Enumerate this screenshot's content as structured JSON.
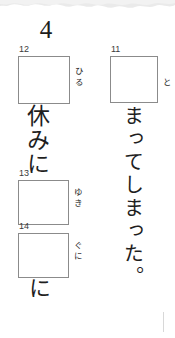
{
  "page": {
    "section_number": "4",
    "background_color": "#ffffff",
    "box_border_color": "#8b8b8b",
    "ink_color": "#1f1f1f"
  },
  "columns": {
    "left": {
      "blanks": [
        {
          "number": "12",
          "furigana": "ひる",
          "x": 18,
          "y": 56,
          "w": 52,
          "h": 48
        },
        {
          "number": "13",
          "furigana": "ゆき",
          "x": 18,
          "y": 180,
          "w": 51,
          "h": 45
        },
        {
          "number": "14",
          "furigana": "ぐに",
          "x": 18,
          "y": 233,
          "w": 51,
          "h": 45
        }
      ],
      "runs": [
        {
          "id": "text-left-1",
          "text": "休みに"
        },
        {
          "id": "text-left-2",
          "text": "に"
        }
      ]
    },
    "right": {
      "blanks": [
        {
          "number": "11",
          "furigana": "と",
          "x": 110,
          "y": 56,
          "w": 48,
          "h": 47
        }
      ],
      "runs": [
        {
          "id": "text-right-1",
          "text": "まってしまった。"
        }
      ]
    }
  },
  "decor": {
    "scan_edge_name": "scanned-page-top-edge",
    "scan_edge_color": "#e9e9e9"
  }
}
